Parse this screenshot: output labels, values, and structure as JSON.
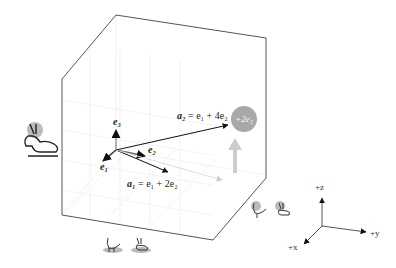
{
  "figure": {
    "vectors": {
      "e1": "e₁",
      "e2": "e₂",
      "e3": "e₃",
      "a1_lhs": "a₁",
      "a1_rhs": "= e₁ + 2e₂",
      "a2_lhs": "a₂",
      "a2_rhs": "= e₁ + 4e₂",
      "a2_extra": "+2e₃"
    },
    "axes": {
      "z": "+z",
      "y": "+y",
      "x": "+x"
    },
    "icons": [
      "rabbit-icon",
      "chicken-icon",
      "rabbit-icon",
      "chicken-icon",
      "rabbit-icon"
    ],
    "colors": {
      "outline": "#555555",
      "grid": "#e6e6e6",
      "highlight": "#a8a8a8",
      "arrow": "#111111"
    }
  }
}
